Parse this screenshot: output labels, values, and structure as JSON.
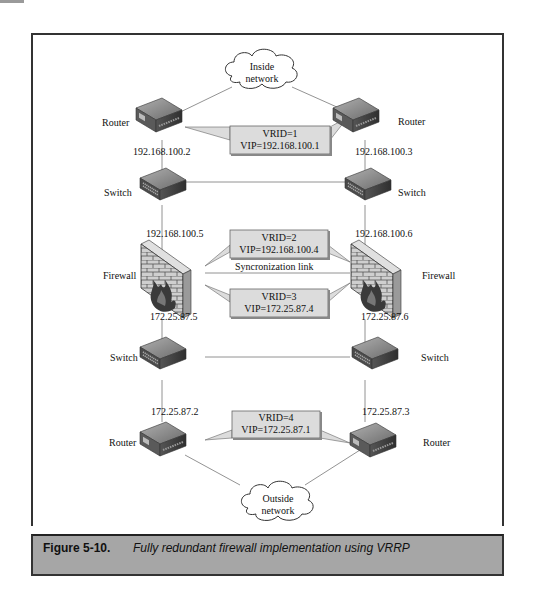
{
  "figure": {
    "number": "Figure 5-10.",
    "caption": "Fully redundant firewall implementation using VRRP"
  },
  "clouds": {
    "inside": {
      "line1": "Inside",
      "line2": "network"
    },
    "outside": {
      "line1": "Outside",
      "line2": "network"
    }
  },
  "devices": {
    "router_top_left": {
      "label": "Router",
      "ip": "192.168.100.2"
    },
    "router_top_right": {
      "label": "Router",
      "ip": "192.168.100.3"
    },
    "switch_top_left": {
      "label": "Switch",
      "ip": "192.168.100.5"
    },
    "switch_top_right": {
      "label": "Switch",
      "ip": "192.168.100.6"
    },
    "firewall_left": {
      "label": "Firewall",
      "ip": "172.25.87.5"
    },
    "firewall_right": {
      "label": "Firewall",
      "ip": "172.25.87.6"
    },
    "switch_bottom_left": {
      "label": "Switch",
      "ip": "172.25.87.2"
    },
    "switch_bottom_right": {
      "label": "Switch",
      "ip": "172.25.87.3"
    },
    "router_bottom_left": {
      "label": "Router"
    },
    "router_bottom_right": {
      "label": "Router"
    }
  },
  "callouts": [
    {
      "vrid": "VRID=1",
      "vip": "VIP=192.168.100.1"
    },
    {
      "vrid": "VRID=2",
      "vip": "VIP=192.168.100.4"
    },
    {
      "vrid": "VRID=3",
      "vip": "VIP=172.25.87.4"
    },
    {
      "vrid": "VRID=4",
      "vip": "VIP=172.25.87.1"
    }
  ],
  "sync_link": "Syncronization link",
  "colors": {
    "frame": "#333333",
    "caption_bg": "#a6a6a6",
    "callout_bg": "#dcdcdc",
    "device_dark": "#4a4a4a",
    "device_light": "#9a9a9a",
    "brick": "#c8c8c8"
  }
}
